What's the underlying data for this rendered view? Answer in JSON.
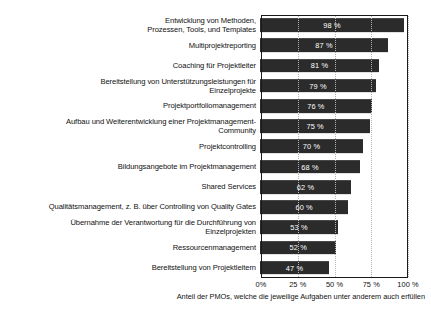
{
  "chart_data": {
    "type": "bar",
    "orientation": "horizontal",
    "title": "",
    "subtitle": "",
    "xlabel": "Anteil der PMOs, welche die jeweilige Aufgaben unter anderem auch erfüllen",
    "ylabel": "",
    "xlim": [
      0,
      100
    ],
    "xticks": [
      0,
      25,
      50,
      75,
      100
    ],
    "xticklabels": [
      "0%",
      "25 %",
      "50 %",
      "75 %",
      "100 %"
    ],
    "grid": "vertical-dotted",
    "legend": null,
    "bar_color": "#2b2b2b",
    "value_label_color": "#ffffff",
    "categories": [
      "Entwicklung von Methoden,\nProzessen, Tools, und Templates",
      "Multiprojektreporting",
      "Coaching für Projektleiter",
      "Bereitstellung von Unterstützungsleistungen für\nEinzelprojekte",
      "Projektportfoliomanagement",
      "Aufbau und Weiterentwicklung einer Projektmanagement-\nCommunity",
      "Projektcontrolling",
      "Bildungsangebote im Projektmanagement",
      "Shared Services",
      "Qualitätsmanagement, z. B. über Controlling von Quality Gates",
      "Übernahme der Verantwortung für die Durchführung von\nEinzelprojekten",
      "Ressourcenmanagement",
      "Bereitstellung von Projektleitern"
    ],
    "values": [
      98,
      87,
      81,
      79,
      76,
      75,
      70,
      68,
      62,
      60,
      53,
      52,
      47
    ],
    "value_labels": [
      "98 %",
      "87 %",
      "81 %",
      "79 %",
      "76 %",
      "75 %",
      "70 %",
      "68 %",
      "62 %",
      "60 %",
      "53 %",
      "52 %",
      "47 %"
    ]
  }
}
